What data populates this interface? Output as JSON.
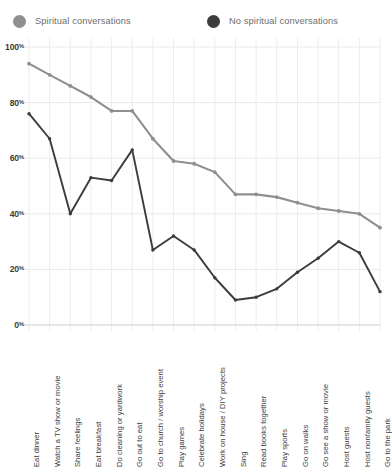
{
  "legend": {
    "entries": [
      {
        "label": "Spiritual conversations",
        "color": "#8f8f8f",
        "dot": "legend-dot-light"
      },
      {
        "label": "No spiritual conversations",
        "color": "#3c3c3c",
        "dot": "legend-dot-dark"
      }
    ]
  },
  "axes": {
    "y_ticks": [
      "100",
      "80",
      "60",
      "40",
      "20",
      "0"
    ],
    "y_suffix": "%"
  },
  "chart_data": {
    "type": "line",
    "title": "",
    "xlabel": "",
    "ylabel": "",
    "ylim": [
      0,
      100
    ],
    "grid": true,
    "legend_position": "top",
    "categories": [
      "Eat dinner",
      "Watch a TV show or movie",
      "Share feelings",
      "Eat breakfast",
      "Do cleaning or yardwork",
      "Go out to eat",
      "Go to church / worship event",
      "Play games",
      "Celebrate holidays",
      "Work on house / DIY projects",
      "Sing",
      "Read books together",
      "Play sports",
      "Go on walks",
      "Go see a show or movie",
      "Host guests",
      "Host nonfamily guests",
      "Go to the park"
    ],
    "series": [
      {
        "name": "Spiritual conversations",
        "color": "#8f8f8f",
        "values": [
          94,
          90,
          86,
          82,
          77,
          77,
          67,
          59,
          58,
          55,
          47,
          47,
          46,
          44,
          42,
          41,
          40,
          35
        ]
      },
      {
        "name": "No spiritual conversations",
        "color": "#3c3c3c",
        "values": [
          76,
          67,
          40,
          53,
          52,
          63,
          27,
          32,
          27,
          17,
          9,
          10,
          13,
          19,
          24,
          30,
          26,
          12
        ]
      }
    ],
    "y_tick_values": [
      0,
      20,
      40,
      60,
      80,
      100
    ]
  }
}
